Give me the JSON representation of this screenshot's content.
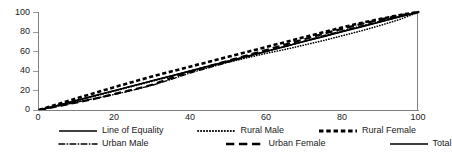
{
  "chart_data": {
    "type": "line",
    "title": "",
    "xlabel": "",
    "ylabel": "",
    "xlim": [
      0,
      100
    ],
    "ylim": [
      0,
      100
    ],
    "grid": false,
    "legend_position": "bottom",
    "xticks": [
      0,
      20,
      40,
      60,
      80,
      100
    ],
    "yticks": [
      0,
      20,
      40,
      60,
      80,
      100
    ],
    "x": [
      0,
      5,
      10,
      15,
      20,
      25,
      30,
      35,
      40,
      45,
      50,
      55,
      60,
      65,
      70,
      75,
      80,
      85,
      90,
      95,
      100
    ],
    "series": [
      {
        "name": "Line of Equality",
        "style": "solid",
        "width": 1.4,
        "color": "#000000",
        "values": [
          0,
          5,
          10,
          15,
          20,
          25,
          30,
          35,
          40,
          45,
          50,
          55,
          60,
          65,
          70,
          75,
          80,
          85,
          90,
          95,
          100
        ]
      },
      {
        "name": "Rural Male",
        "style": "dotted",
        "width": 1.6,
        "color": "#000000",
        "values": [
          0,
          4.5,
          9.5,
          14.5,
          19.5,
          24.5,
          29.5,
          34.5,
          39.5,
          44.5,
          49.0,
          53.5,
          58.0,
          62.0,
          66.5,
          71.0,
          76.0,
          81.0,
          86.5,
          92.5,
          100
        ]
      },
      {
        "name": "Rural Female",
        "style": "dashed",
        "width": 2.6,
        "color": "#000000",
        "values": [
          0,
          6.0,
          12.0,
          17.8,
          23.5,
          29.0,
          34.5,
          39.5,
          44.5,
          49.5,
          54.5,
          59.5,
          64.5,
          69.5,
          74.5,
          79.5,
          84.5,
          89.0,
          93.0,
          97.0,
          100
        ]
      },
      {
        "name": "Urban Male",
        "style": "dashdot",
        "width": 1.4,
        "color": "#000000",
        "values": [
          0,
          4.0,
          8.0,
          12.0,
          16.0,
          20.5,
          25.5,
          31.5,
          38.0,
          43.5,
          49.0,
          54.5,
          60.0,
          65.0,
          70.5,
          76.0,
          81.0,
          86.0,
          91.0,
          95.5,
          100
        ]
      },
      {
        "name": "Urban Female",
        "style": "longdash",
        "width": 2.2,
        "color": "#000000",
        "values": [
          0,
          3.8,
          7.8,
          11.8,
          16.5,
          21.0,
          26.0,
          33.0,
          39.5,
          45.0,
          50.5,
          56.0,
          61.5,
          67.0,
          72.5,
          78.0,
          83.0,
          88.0,
          92.5,
          96.5,
          100
        ]
      },
      {
        "name": "Total",
        "style": "solid",
        "width": 1.2,
        "color": "#000000",
        "values": [
          0,
          4.8,
          9.8,
          14.8,
          19.8,
          25.0,
          30.2,
          35.2,
          40.2,
          45.2,
          50.2,
          55.2,
          60.2,
          65.2,
          70.2,
          75.2,
          80.2,
          85.2,
          90.2,
          95.2,
          100
        ]
      }
    ]
  },
  "axes": {
    "y_labels": [
      "100",
      "80",
      "60",
      "40",
      "20",
      "0"
    ],
    "x_labels": [
      "0",
      "20",
      "40",
      "60",
      "80",
      "100"
    ]
  },
  "legend": {
    "items": [
      {
        "label": "Line of Equality",
        "style": "solid"
      },
      {
        "label": "Rural Male",
        "style": "dotted"
      },
      {
        "label": "Rural Female",
        "style": "dashed"
      },
      {
        "label": "Urban Male",
        "style": "dashdot"
      },
      {
        "label": "Urban Female",
        "style": "longdash"
      },
      {
        "label": "Total",
        "style": "solid"
      }
    ]
  },
  "colors": {
    "line": "#000000",
    "axis": "#808080",
    "text": "#1a1a1a",
    "background": "#ffffff"
  }
}
